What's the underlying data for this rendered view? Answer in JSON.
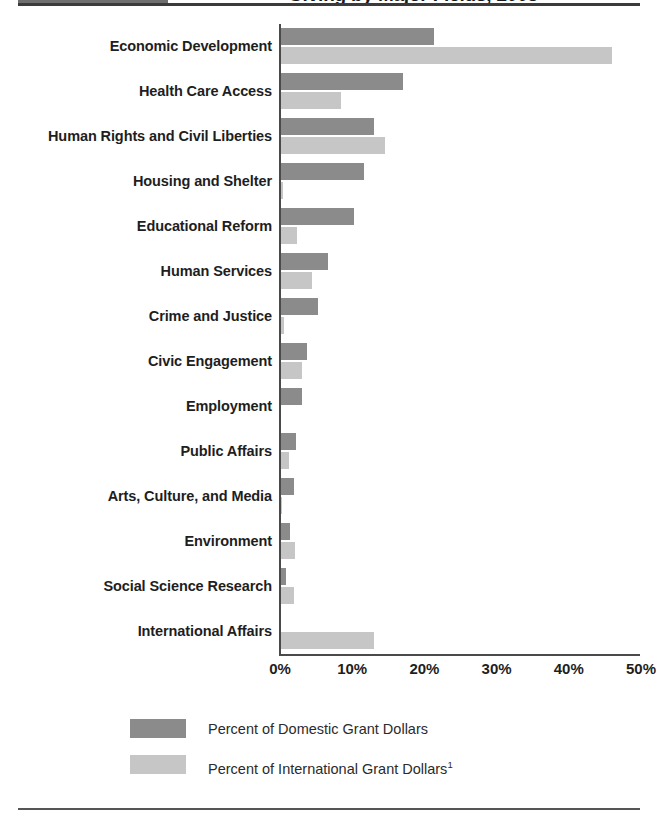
{
  "title": {
    "text": "Giving by Major Fields, 2008",
    "swatch_color": "#6f6f6f"
  },
  "colors": {
    "domestic": "#8b8b8b",
    "international": "#c6c6c6",
    "axis": "#4a4a4a",
    "text": "#1e1e1e",
    "background": "#ffffff"
  },
  "legend": {
    "items": [
      {
        "label": "Percent of Domestic Grant Dollars",
        "sup": "",
        "color": "#8b8b8b"
      },
      {
        "label": "Percent of International Grant Dollars",
        "sup": "1",
        "color": "#c6c6c6"
      }
    ]
  },
  "axis": {
    "ticks": [
      "0%",
      "10%",
      "20%",
      "30%",
      "40%",
      "50%"
    ],
    "min": 0,
    "max": 50
  },
  "chart_data": {
    "type": "bar",
    "orientation": "horizontal",
    "title": "Giving by Major Fields, 2008",
    "xlabel": "",
    "ylabel": "",
    "xlim": [
      0,
      50
    ],
    "grid": false,
    "legend_position": "bottom",
    "categories": [
      "Economic Development",
      "Health Care Access",
      "Human Rights and Civil Liberties",
      "Housing and Shelter",
      "Educational Reform",
      "Human Services",
      "Crime and Justice",
      "Civic Engagement",
      "Employment",
      "Public Affairs",
      "Arts, Culture, and Media",
      "Environment",
      "Social Science Research",
      "International Affairs"
    ],
    "series": [
      {
        "name": "Percent of Domestic Grant Dollars",
        "color": "#8b8b8b",
        "values": [
          21.3,
          17.0,
          13.0,
          11.7,
          10.3,
          6.6,
          5.2,
          3.7,
          3.0,
          2.2,
          2.0,
          1.4,
          0.8,
          0.0
        ]
      },
      {
        "name": "Percent of International Grant Dollars",
        "color": "#c6c6c6",
        "values": [
          46.0,
          8.4,
          14.5,
          0.4,
          2.4,
          4.4,
          0.5,
          3.0,
          0.0,
          1.2,
          0.3,
          2.1,
          1.9,
          13.0
        ]
      }
    ]
  }
}
